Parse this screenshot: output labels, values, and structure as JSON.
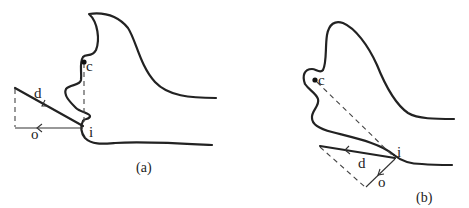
{
  "figure": {
    "panels": [
      {
        "id": "a",
        "caption": "(a)",
        "labels": {
          "center": "c",
          "intersection": "i",
          "direction": "d",
          "offset": "o"
        }
      },
      {
        "id": "b",
        "caption": "(b)",
        "labels": {
          "center": "c",
          "intersection": "i",
          "direction": "d",
          "offset": "o"
        }
      }
    ],
    "colors": {
      "stroke": "#222222",
      "background": "#ffffff"
    }
  }
}
